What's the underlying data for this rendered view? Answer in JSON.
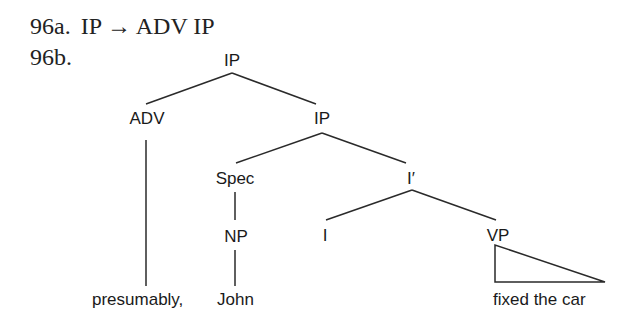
{
  "examples": {
    "a": {
      "label": "96a.",
      "rule": "IP → ADV IP"
    },
    "b": {
      "label": "96b."
    }
  },
  "tree": {
    "nodes": {
      "root_ip": "IP",
      "adv": "ADV",
      "ip2": "IP",
      "spec": "Spec",
      "ibar": "I′",
      "np": "NP",
      "i": "I",
      "vp": "VP"
    },
    "leaves": {
      "adv_leaf": "presumably,",
      "np_leaf": "John",
      "vp_leaf": "fixed the car"
    }
  }
}
